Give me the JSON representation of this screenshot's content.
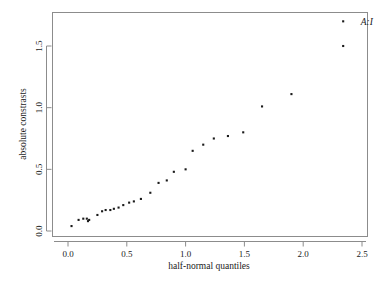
{
  "chart_data": {
    "type": "scatter",
    "title": "",
    "xlabel": "half-normal quantiles",
    "ylabel": "absolute constrasts",
    "xlim": [
      -0.12,
      2.62
    ],
    "ylim": [
      -0.04,
      1.78
    ],
    "xticks": [
      "0.0",
      "0.5",
      "1.0",
      "1.5",
      "2.0",
      "2.5"
    ],
    "xtick_values": [
      0.0,
      0.5,
      1.0,
      1.5,
      2.0,
      2.5
    ],
    "yticks": [
      "0.0",
      "0.5",
      "1.0",
      "1.5"
    ],
    "ytick_values": [
      0.0,
      0.5,
      1.0,
      1.5
    ],
    "grid": false,
    "legend": "none",
    "point_symbol": "filled-square",
    "point_color": "#1a1a1a",
    "x": [
      0.03,
      0.09,
      0.13,
      0.16,
      0.17,
      0.18,
      0.25,
      0.29,
      0.32,
      0.36,
      0.39,
      0.43,
      0.47,
      0.52,
      0.56,
      0.62,
      0.7,
      0.77,
      0.84,
      0.9,
      1.0,
      1.06,
      1.15,
      1.24,
      1.36,
      1.49,
      1.65,
      1.9,
      2.34
    ],
    "y": [
      0.04,
      0.09,
      0.1,
      0.1,
      0.08,
      0.09,
      0.13,
      0.16,
      0.17,
      0.17,
      0.18,
      0.19,
      0.21,
      0.23,
      0.24,
      0.26,
      0.31,
      0.39,
      0.41,
      0.48,
      0.5,
      0.65,
      0.7,
      0.75,
      0.77,
      0.8,
      1.01,
      1.11,
      1.5
    ],
    "annotations": [
      {
        "label": "A:I",
        "x": 2.34,
        "y": 1.7,
        "label_offset_x": 0.15,
        "label_offset_y": -0.03
      }
    ],
    "labeled_point": {
      "x": 2.34,
      "y": 1.7
    }
  },
  "axes": {
    "x_axis_name": "half-normal-quantiles-axis",
    "y_axis_name": "absolute-contrasts-axis"
  }
}
